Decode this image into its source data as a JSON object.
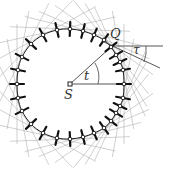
{
  "diagram": {
    "labels": {
      "center": "S",
      "point": "Q",
      "angle_t": "t",
      "angle_tau": "τ"
    },
    "colors": {
      "curve": "#222222",
      "ticks": "#111111",
      "rays": "#aaaaaa",
      "construction": "#444444",
      "background": "#ffffff"
    },
    "center": [
      70,
      84
    ],
    "q_point": [
      111,
      47
    ],
    "curve_points": [
      [
        124,
        84
      ],
      [
        123,
        70
      ],
      [
        120,
        62
      ],
      [
        116,
        55
      ],
      [
        111,
        47
      ],
      [
        104,
        40
      ],
      [
        94,
        35
      ],
      [
        83,
        31
      ],
      [
        70,
        29
      ],
      [
        57,
        30
      ],
      [
        43,
        35
      ],
      [
        31,
        44
      ],
      [
        22,
        57
      ],
      [
        18,
        70
      ],
      [
        17,
        84
      ],
      [
        18,
        98
      ],
      [
        22,
        111
      ],
      [
        31,
        124
      ],
      [
        43,
        133
      ],
      [
        57,
        138
      ],
      [
        70,
        139
      ],
      [
        83,
        137
      ],
      [
        94,
        133
      ],
      [
        104,
        128
      ],
      [
        111,
        121
      ],
      [
        116,
        113
      ],
      [
        120,
        106
      ],
      [
        123,
        98
      ]
    ]
  }
}
